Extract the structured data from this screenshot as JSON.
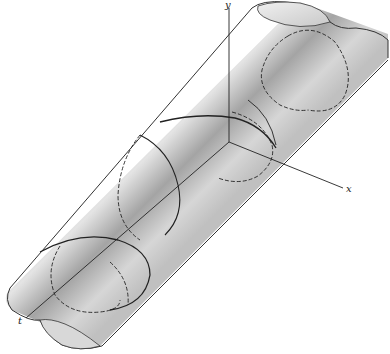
{
  "figure": {
    "axes": {
      "x_label": "x",
      "y_label": "y",
      "t_label": "t"
    },
    "colors": {
      "cylinder_light": "#e6e6e6",
      "cylinder_mid": "#bdbdbd",
      "cylinder_dark": "#8a8a8a",
      "line": "#222222"
    }
  }
}
